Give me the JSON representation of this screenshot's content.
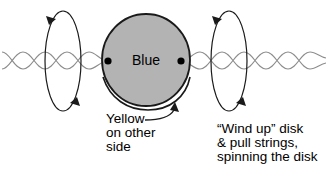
{
  "figure": {
    "disk": {
      "label": "Blue",
      "fill_color": "#b3b3b3",
      "outline_color": "#1a1a1a",
      "center_x": 146,
      "center_y": 60,
      "radius_x": 44,
      "radius_y": 46
    },
    "axle_dots": [
      {
        "name": "left-axle-dot",
        "x": 108,
        "y": 61
      },
      {
        "name": "right-axle-dot",
        "x": 181,
        "y": 61
      }
    ],
    "strings": {
      "color": "#8c8c8c",
      "description": "two twisted sine-wave strings passing through the disk hubs",
      "baseline_y": 61,
      "amplitude": 9
    },
    "rotation_loops": [
      {
        "name": "left-rotation-loop",
        "center_x": 63,
        "center_y": 61,
        "radius_x": 18,
        "radius_y": 50,
        "color": "#1a1a1a"
      },
      {
        "name": "right-rotation-loop",
        "center_x": 229,
        "center_y": 61,
        "radius_x": 18,
        "radius_y": 50,
        "color": "#1a1a1a"
      }
    ],
    "captions": {
      "yellow": {
        "lines": [
          "Yellow",
          "on other",
          "side"
        ],
        "text": "Yellow on other side"
      },
      "windup": {
        "lines": [
          "“Wind up” disk",
          "& pull strings,",
          "spinning the disk"
        ],
        "text": "“Wind up” disk & pull strings, spinning the disk"
      }
    },
    "pointer_arrow": {
      "name": "yellow-pointer-arrow",
      "color": "#1a1a1a",
      "description": "curved arrow from Yellow caption to underside of disk"
    }
  }
}
